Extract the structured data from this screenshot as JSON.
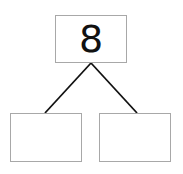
{
  "number_bond": {
    "whole": "8",
    "parts": [
      "",
      ""
    ]
  },
  "colors": {
    "box_border": "#a8a8a8",
    "line": "#111111",
    "text": "#111111"
  }
}
